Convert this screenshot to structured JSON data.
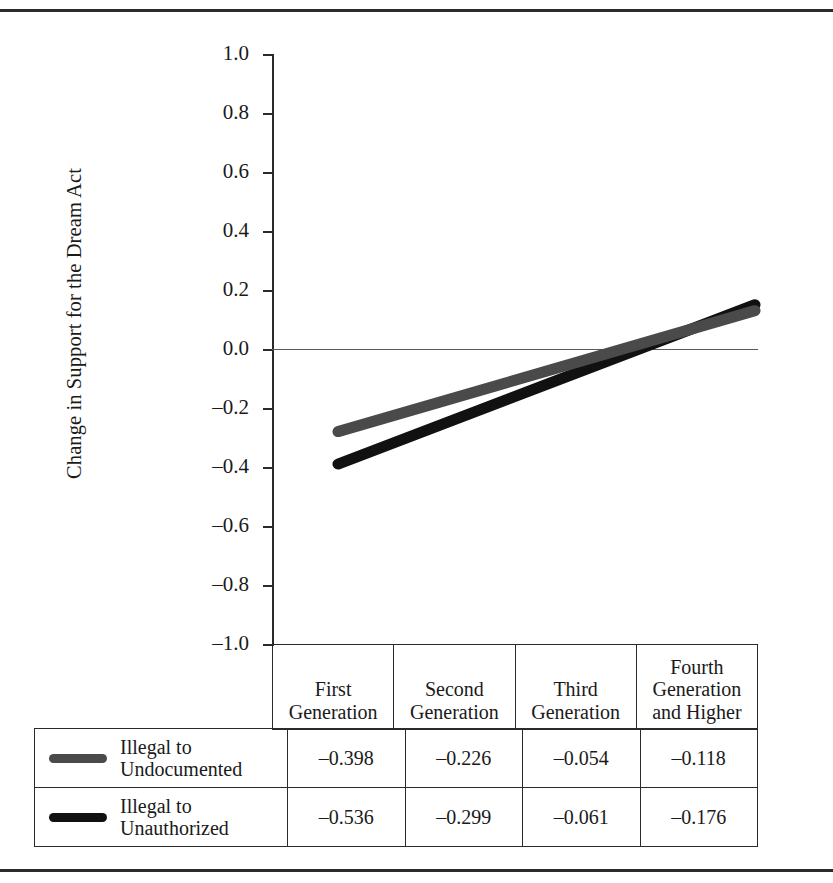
{
  "chart_data": {
    "type": "line",
    "title": "",
    "xlabel": "",
    "ylabel": "Change in Support for the Dream Act",
    "ylim": [
      -1.0,
      1.0
    ],
    "ytick_labels": [
      "1.0",
      "0.8",
      "0.6",
      "0.4",
      "0.2",
      "0.0",
      "–0.2",
      "–0.4",
      "–0.6",
      "–0.8",
      "–1.0"
    ],
    "ytick_values": [
      1.0,
      0.8,
      0.6,
      0.4,
      0.2,
      0.0,
      -0.2,
      -0.4,
      -0.6,
      -0.8,
      -1.0
    ],
    "grid": false,
    "zero_reference_line": true,
    "legend_position": "table-left",
    "categories": [
      "First Generation",
      "Second Generation",
      "Third Generation",
      "Fourth Generation and Higher"
    ],
    "series": [
      {
        "name": "Illegal to Undocumented",
        "color": "#4a4a4a",
        "values": [
          -0.398,
          -0.226,
          -0.054,
          -0.118
        ],
        "trend_endpoints": [
          -0.28,
          0.13
        ]
      },
      {
        "name": "Illegal to Unauthorized",
        "color": "#111111",
        "values": [
          -0.536,
          -0.299,
          -0.061,
          -0.176
        ],
        "trend_endpoints": [
          -0.39,
          0.15
        ]
      }
    ]
  },
  "axis": {
    "y_title": "Change in Support for the Dream Act",
    "ticks": [
      {
        "label": "1.0",
        "value": 1.0
      },
      {
        "label": "0.8",
        "value": 0.8
      },
      {
        "label": "0.6",
        "value": 0.6
      },
      {
        "label": "0.4",
        "value": 0.4
      },
      {
        "label": "0.2",
        "value": 0.2
      },
      {
        "label": "0.0",
        "value": 0.0
      },
      {
        "label": "–0.2",
        "value": -0.2
      },
      {
        "label": "–0.4",
        "value": -0.4
      },
      {
        "label": "–0.6",
        "value": -0.6
      },
      {
        "label": "–0.8",
        "value": -0.8
      },
      {
        "label": "–1.0",
        "value": -1.0
      }
    ]
  },
  "table": {
    "column_headers": [
      "First\nGeneration",
      "Second\nGeneration",
      "Third\nGeneration",
      "Fourth\nGeneration\nand Higher"
    ],
    "column_headers_lines": [
      [
        "First",
        "Generation"
      ],
      [
        "Second",
        "Generation"
      ],
      [
        "Third",
        "Generation"
      ],
      [
        "Fourth",
        "Generation",
        "and Higher"
      ]
    ],
    "rows": [
      {
        "legend_lines": [
          "Illegal to",
          "Undocumented"
        ],
        "swatch_color": "#4a4a4a",
        "values": [
          "–0.398",
          "–0.226",
          "–0.054",
          "–0.118"
        ]
      },
      {
        "legend_lines": [
          "Illegal to",
          "Unauthorized"
        ],
        "swatch_color": "#111111",
        "values": [
          "–0.536",
          "–0.299",
          "–0.061",
          "–0.176"
        ]
      }
    ]
  },
  "colors": {
    "rule": "#2b2b2b",
    "series_gray": "#4a4a4a",
    "series_black": "#111111",
    "zero_line": "#595959"
  }
}
